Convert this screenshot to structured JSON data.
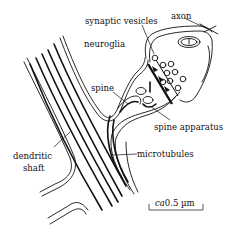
{
  "diagram": {
    "labels": {
      "axon": "axon",
      "synaptic_vesicles": "synaptic vesicles",
      "neuroglia": "neuroglia",
      "spine": "spine",
      "spine_apparatus": "spine apparatus",
      "microtubules": "microtubules",
      "dendritic_shaft_line1": "dendritic",
      "dendritic_shaft_line2": "shaft"
    },
    "scale_bar": {
      "prefix": "ca",
      "value": "0.5 µm"
    },
    "colors": {
      "ink": "#111111",
      "background": "#ffffff"
    }
  }
}
